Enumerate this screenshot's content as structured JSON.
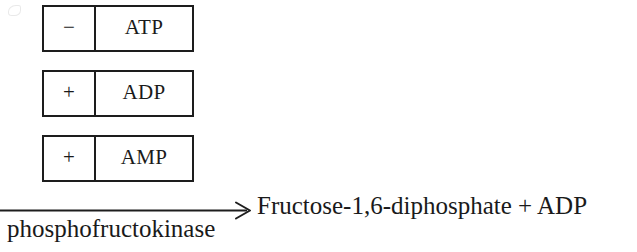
{
  "figure": {
    "type": "biochemical-reaction-diagram",
    "background_color": "#ffffff",
    "ink_color": "#1d1d1d"
  },
  "effectors": {
    "caption": "Allosteric effectors of phosphofructokinase",
    "items": [
      {
        "sign": "−",
        "sign_name": "minus",
        "molecule": "ATP"
      },
      {
        "sign": "+",
        "sign_name": "plus",
        "molecule": "ADP"
      },
      {
        "sign": "+",
        "sign_name": "plus",
        "molecule": "AMP"
      }
    ]
  },
  "reaction": {
    "arrow_glyph": "→",
    "enzyme_label": "phosphofructokinase",
    "products": "Fructose-1,6-diphosphate + ADP"
  }
}
